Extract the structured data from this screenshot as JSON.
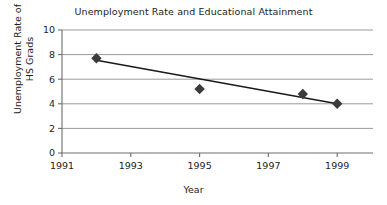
{
  "chart_data": {
    "type": "scatter",
    "title": "Unemployment Rate and Educational Attainment",
    "xlabel": "Year",
    "ylabel": "Unemployment Rate of HS Grads",
    "ylabel_lines": [
      "Unemployment Rate of",
      "HS Grads"
    ],
    "x": [
      1992,
      1995,
      1998,
      1999
    ],
    "values": [
      7.7,
      5.2,
      4.8,
      4.0
    ],
    "points": [
      {
        "x": 1992,
        "y": 7.7
      },
      {
        "x": 1995,
        "y": 5.2
      },
      {
        "x": 1998,
        "y": 4.8
      },
      {
        "x": 1999,
        "y": 4.0
      }
    ],
    "trendline": {
      "label": "linear trend",
      "x": [
        1992,
        1999
      ],
      "y": [
        7.55,
        4.0
      ]
    },
    "xlim": [
      1991,
      2000
    ],
    "ylim": [
      0,
      10
    ],
    "xticks": [
      1991,
      1993,
      1995,
      1997,
      1999
    ],
    "xtick_labels": [
      "1991",
      "1993",
      "1995",
      "1997",
      "1999"
    ],
    "yticks": [
      0,
      2,
      4,
      6,
      8,
      10
    ],
    "ytick_labels": [
      "0",
      "2",
      "4",
      "6",
      "8",
      "10"
    ],
    "grid": "horizontal",
    "legend": null,
    "marker": "diamond",
    "marker_color": "#3b3b3b",
    "line_color": "#1a1a1a",
    "grid_color": "#9a9a9a",
    "axis_color": "#6e6e6e"
  }
}
